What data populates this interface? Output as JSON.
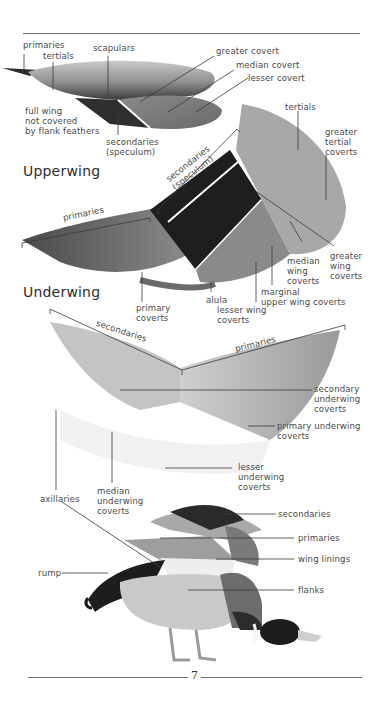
{
  "page": {
    "page_number": "7",
    "colors": {
      "rule": "#6e6e6e",
      "text": "#4a4a4a",
      "heading": "#2e2e2e"
    }
  },
  "folded_wing": {
    "labels": {
      "primaries": "primaries",
      "tertials": "tertials",
      "scapulars": "scapulars",
      "greater_covert": "greater covert",
      "median_covert": "median covert",
      "lesser_covert": "lesser covert",
      "full_wing_note": "full wing\nnot covered\nby flank feathers",
      "secondaries": "secondaries\n(speculum)"
    }
  },
  "upperwing": {
    "heading": "Upperwing",
    "labels": {
      "secondaries_bracket": "secondaries\n(speculum)",
      "primaries_bracket": "primaries",
      "tertials": "tertials",
      "greater_tertial_coverts": "greater\ntertial\ncoverts",
      "greater_wing_coverts": "greater\nwing\ncoverts",
      "median_wing_coverts": "median\nwing\ncoverts",
      "marginal_coverts": "marginal\nupper wing coverts",
      "lesser_wing_coverts": "lesser wing\ncoverts",
      "alula": "alula",
      "primary_coverts": "primary\ncoverts"
    }
  },
  "underwing": {
    "heading": "Underwing",
    "labels": {
      "secondaries_bracket": "secondaries",
      "primaries_bracket": "primaries",
      "secondary_underwing_coverts": "secondary\nunderwing\ncoverts",
      "primary_underwing_coverts": "primary underwing\ncoverts",
      "lesser_underwing_coverts": "lesser\nunderwing\ncoverts",
      "median_underwing_coverts": "median\nunderwing\ncoverts",
      "axillaries": "axillaries"
    }
  },
  "duck": {
    "labels": {
      "secondaries": "secondaries",
      "primaries": "primaries",
      "wing_linings": "wing linings",
      "rump": "rump",
      "flanks": "flanks"
    }
  }
}
